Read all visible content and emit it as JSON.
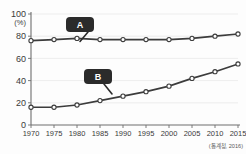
{
  "chart_data": {
    "type": "line",
    "title": "",
    "subtitle": "",
    "xlabel": "(년)",
    "ylabel": "(%)",
    "xlim": [
      1970,
      2015
    ],
    "ylim": [
      0,
      100
    ],
    "grid": true,
    "legend_position": "inline-callout",
    "x": [
      1970,
      1975,
      1980,
      1985,
      1990,
      1995,
      2000,
      2005,
      2010,
      2015
    ],
    "xtick_labels": [
      "1970",
      "1975",
      "1980",
      "1985",
      "1990",
      "1995",
      "2000",
      "2005",
      "2010",
      "2015"
    ],
    "ytick_labels": [
      "0",
      "20",
      "40",
      "60",
      "80",
      "100"
    ],
    "ytick_values": [
      0,
      20,
      40,
      60,
      80,
      100
    ],
    "series": [
      {
        "name": "A",
        "label": "A",
        "color": "#3c3c3c",
        "marker": "circle-open",
        "values": [
          76,
          77,
          78,
          77,
          77,
          77,
          77,
          78,
          80,
          82
        ]
      },
      {
        "name": "B",
        "label": "B",
        "color": "#3c3c3c",
        "marker": "circle-open",
        "values": [
          16,
          16,
          18,
          22,
          26,
          30,
          35,
          42,
          48,
          55
        ]
      }
    ],
    "annotations": [
      {
        "text": "A",
        "target_series": "A",
        "target_x": 1985
      },
      {
        "text": "B",
        "target_series": "B",
        "target_x": 1990
      }
    ],
    "source": "(통계청, 2016)"
  },
  "axis": {
    "y_unit": "(%)",
    "x_unit": "(년)"
  },
  "labels": {
    "badge_a": "A",
    "badge_b": "B",
    "source": "(통계청, 2016)"
  }
}
